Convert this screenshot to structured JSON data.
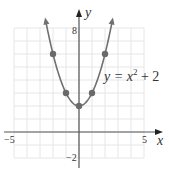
{
  "chart_data": {
    "type": "line",
    "title": "",
    "equation_label": "y = x² + 2",
    "equation_parts": {
      "lhs": "y = x",
      "exp": "2",
      "rhs": " + 2"
    },
    "xlabel": "x",
    "ylabel": "y",
    "xlim": [
      -5,
      5
    ],
    "ylim": [
      -2,
      8
    ],
    "x_tick_labels": [
      {
        "value": -5,
        "label": "−5"
      },
      {
        "value": 5,
        "label": "5"
      }
    ],
    "y_tick_labels": [
      {
        "value": 8,
        "label": "8"
      },
      {
        "value": -2,
        "label": "−2"
      }
    ],
    "grid": true,
    "function": "x^2 + 2",
    "series": [
      {
        "name": "y = x² + 2",
        "points": [
          {
            "x": -2,
            "y": 6
          },
          {
            "x": -1,
            "y": 3
          },
          {
            "x": 0,
            "y": 2
          },
          {
            "x": 1,
            "y": 3
          },
          {
            "x": 2,
            "y": 6
          }
        ]
      }
    ],
    "colors": {
      "curve": "#707070",
      "points": "#6a6a6a",
      "axis": "#555555",
      "grid": "#e6e6e6"
    }
  }
}
